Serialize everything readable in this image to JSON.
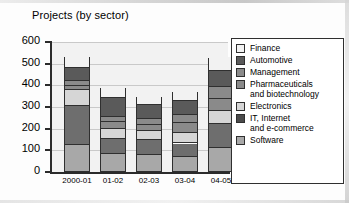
{
  "chart_data": {
    "type": "bar",
    "subtype": "stacked-bar",
    "title": "Projects (by sector)",
    "xlabel": "",
    "ylabel": "",
    "ylim": [
      0,
      600
    ],
    "ytick_step": 100,
    "yticks": [
      "0",
      "100",
      "200",
      "300",
      "400",
      "500",
      "600"
    ],
    "grid": true,
    "legend_position": "right",
    "categories": [
      "2000-01",
      "01-02",
      "02-03",
      "03-04",
      "04-05"
    ],
    "series": [
      {
        "name": "Software",
        "color": "#a8a8a8",
        "values": [
          118,
          78,
          75,
          65,
          105
        ]
      },
      {
        "name": "IT, Internet and e-commerce",
        "color": "#6e6e6e",
        "values": [
          180,
          72,
          68,
          62,
          110
        ]
      },
      {
        "name": "Electronics",
        "color": "#d6d6d6",
        "values": [
          78,
          45,
          42,
          48,
          60
        ]
      },
      {
        "name": "Pharmaceuticals and biotechnology",
        "color": "#8a8a8a",
        "values": [
          18,
          30,
          28,
          45,
          58
        ]
      },
      {
        "name": "Management",
        "color": "#8a8a8a",
        "values": [
          20,
          22,
          28,
          40,
          55
        ]
      },
      {
        "name": "Automotive",
        "color": "#5a5a5a",
        "values": [
          60,
          88,
          65,
          62,
          75
        ]
      },
      {
        "name": "Finance",
        "color": "#f2f2f2",
        "values": [
          58,
          52,
          42,
          45,
          65
        ]
      }
    ],
    "totals": [
      532,
      387,
      348,
      367,
      528
    ]
  },
  "legend": {
    "items": [
      {
        "label": "Finance",
        "label_line2": "",
        "color": "#f2f2f2"
      },
      {
        "label": "Automotive",
        "label_line2": "",
        "color": "#5a5a5a"
      },
      {
        "label": "Management",
        "label_line2": "",
        "color": "#8a8a8a"
      },
      {
        "label": "Pharmaceuticals",
        "label_line2": "and biotechnology",
        "color": "#8a8a8a"
      },
      {
        "label": "Electronics",
        "label_line2": "",
        "color": "#d6d6d6"
      },
      {
        "label": "IT, Internet",
        "label_line2": "and e-commerce",
        "color": "#4a4a4a"
      },
      {
        "label": "Software",
        "label_line2": "",
        "color": "#a8a8a8"
      }
    ]
  }
}
